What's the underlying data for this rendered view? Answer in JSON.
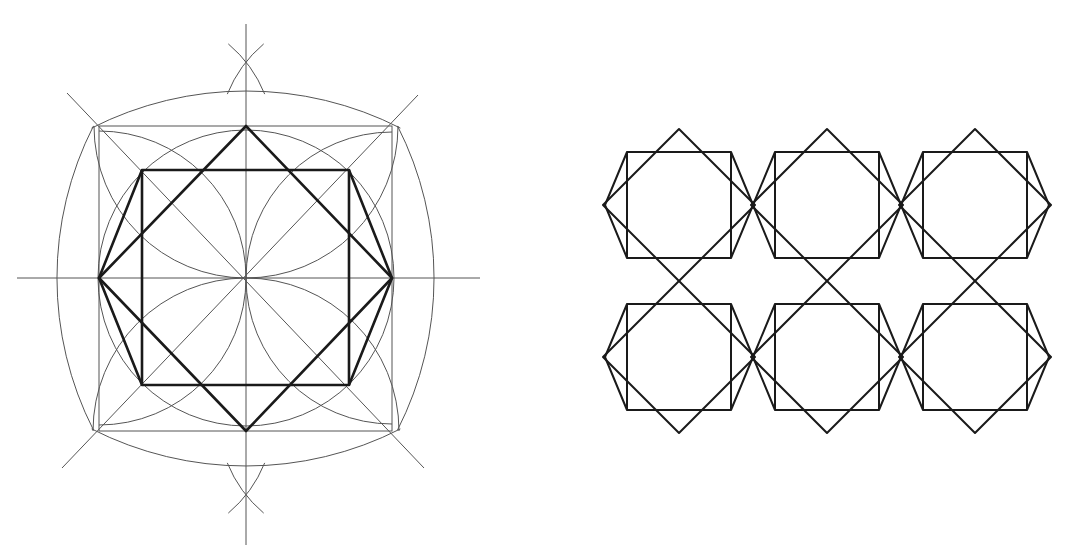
{
  "figures": [
    {
      "id": "construction",
      "description": "Compass-and-straightedge construction of an octagram-like figure: square, rotated square (diamond) and octagon within a bounding square",
      "center": [
        246,
        278
      ],
      "outer_square": {
        "left": 99,
        "top": 126,
        "right": 392,
        "bottom": 431
      },
      "inner_rect": {
        "left": 142,
        "top": 170,
        "right": 349,
        "bottom": 385
      },
      "axes": {
        "horizontal": {
          "y": 278,
          "x1": 17,
          "x2": 480
        },
        "vertical": {
          "x": 246,
          "y1": 24,
          "y2": 545
        }
      },
      "bisector_marks": [
        {
          "cx": 246,
          "cy": 62
        },
        {
          "cx": 246,
          "cy": 495
        }
      ],
      "colors": {
        "construction_line": "#555555",
        "figure_line": "#1a1a1a"
      }
    },
    {
      "id": "tiling",
      "description": "2x3 repeating pattern of square + diamond + hexagonal outline cells",
      "rows": 2,
      "cols": 3,
      "cell_centers": [
        [
          679,
          205
        ],
        [
          827,
          205
        ],
        [
          975,
          205
        ],
        [
          679,
          357
        ],
        [
          827,
          357
        ],
        [
          975,
          357
        ]
      ],
      "cell": {
        "diamond_half": 76,
        "rect_half_w": 52,
        "rect_half_h": 53,
        "side_vertex_dx": 74
      },
      "colors": {
        "line": "#1a1a1a"
      }
    }
  ]
}
